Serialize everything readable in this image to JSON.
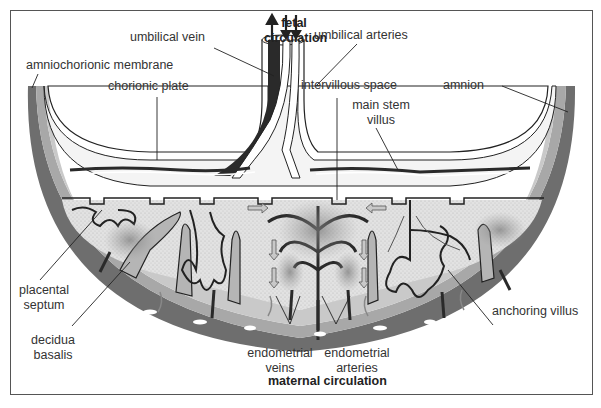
{
  "diagram": {
    "title_top": {
      "line1": "fetal",
      "line2": "circulation"
    },
    "title_bottom": "maternal circulation",
    "labels": {
      "umbilical_vein": "umbilical vein",
      "umbilical_arteries": "umbilical arteries",
      "amniochorionic_membrane": "amniochorionic membrane",
      "chorionic_plate": "chorionic plate",
      "intervillous_space": "intervillous space",
      "amnion": "amnion",
      "main_stem_villus": {
        "line1": "main stem",
        "line2": "villus"
      },
      "placental_septum": {
        "line1": "placental",
        "line2": "septum"
      },
      "decidua_basalis": {
        "line1": "decidua",
        "line2": "basalis"
      },
      "endometrial_veins": {
        "line1": "endometrial",
        "line2": "veins"
      },
      "endometrial_arteries": {
        "line1": "endometrial",
        "line2": "arteries"
      },
      "anchoring_villus": "anchoring villus"
    },
    "colors": {
      "outer_wall": "#6e6e6e",
      "decidua": "#a8a8a8",
      "intervillous": "#d9d9d9",
      "chorion_fill": "#ffffff",
      "vessel_dark": "#2a2a2a",
      "line": "#222222",
      "frame": "#555555"
    }
  }
}
